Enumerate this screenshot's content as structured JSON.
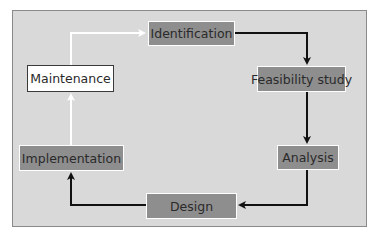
{
  "diagram": {
    "type": "cycle",
    "nodes": [
      {
        "id": "identification",
        "label": "Identification",
        "style": "dark"
      },
      {
        "id": "feasibility",
        "label": "Feasibility study",
        "style": "dark"
      },
      {
        "id": "analysis",
        "label": "Analysis",
        "style": "dark"
      },
      {
        "id": "design",
        "label": "Design",
        "style": "dark"
      },
      {
        "id": "implementation",
        "label": "Implementation",
        "style": "dark"
      },
      {
        "id": "maintenance",
        "label": "Maintenance",
        "style": "light"
      }
    ],
    "edges": [
      {
        "from": "identification",
        "to": "feasibility",
        "color": "#111111"
      },
      {
        "from": "feasibility",
        "to": "analysis",
        "color": "#111111"
      },
      {
        "from": "analysis",
        "to": "design",
        "color": "#111111"
      },
      {
        "from": "design",
        "to": "implementation",
        "color": "#111111"
      },
      {
        "from": "implementation",
        "to": "maintenance",
        "color": "#ffffff"
      },
      {
        "from": "maintenance",
        "to": "identification",
        "color": "#ffffff"
      }
    ],
    "colors": {
      "background": "#d9d9d9",
      "box_dark": "#8e8e8e",
      "box_light": "#ffffff",
      "arrow_dark": "#111111",
      "arrow_light": "#ffffff"
    }
  }
}
